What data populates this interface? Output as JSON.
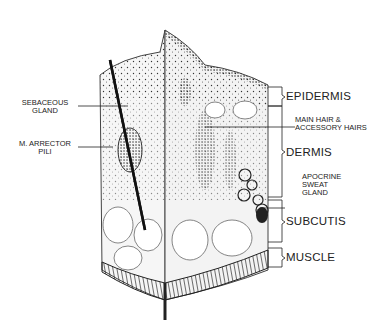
{
  "labels_left": [
    {
      "id": "sebaceous",
      "line1": "SEBACEOUS",
      "line2": "GLAND"
    },
    {
      "id": "arrector",
      "line1": "M. ARRECTOR",
      "line2": "PILI"
    }
  ],
  "labels_right_small": [
    {
      "id": "hair",
      "line1": "MAIN HAIR &",
      "line2": "ACCESSORY HAIRS"
    },
    {
      "id": "apocrine",
      "line1": "APOCRINE",
      "line2": "SWEAT",
      "line3": "GLAND"
    }
  ],
  "layers": [
    {
      "id": "epidermis",
      "label": "EPIDERMIS"
    },
    {
      "id": "dermis",
      "label": "DERMIS"
    },
    {
      "id": "subcutis",
      "label": "SUBCUTIS"
    },
    {
      "id": "muscle",
      "label": "MUSCLE"
    }
  ],
  "colors": {
    "ink": "#222222",
    "background": "#ffffff"
  }
}
